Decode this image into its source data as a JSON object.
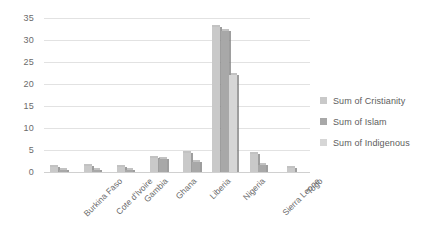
{
  "chart_data": {
    "type": "bar",
    "title": "",
    "subtitle": "",
    "xlabel": "",
    "ylabel": "",
    "ylim": [
      0,
      35
    ],
    "ytick_step": 5,
    "yticks": [
      "0",
      "5",
      "10",
      "15",
      "20",
      "25",
      "30",
      "35"
    ],
    "grid": true,
    "legend_position": "right",
    "categories": [
      "Burkina Faso",
      "Cote d'Ivoire",
      "Gambia",
      "Ghana",
      "Liberia",
      "Nigeria",
      "Sierra Leone",
      "Togo"
    ],
    "series": [
      {
        "name": "Sum of Cristianity",
        "color": "#c9c9c9",
        "values": [
          1.2,
          1.3,
          1.2,
          3.1,
          4.3,
          33.0,
          4.0,
          1.0
        ]
      },
      {
        "name": "Sum of Islam",
        "color": "#a8a8a8",
        "values": [
          0.5,
          0.4,
          0.4,
          3.0,
          2.3,
          32.0,
          1.6,
          0.0
        ]
      },
      {
        "name": "Sum of Indigenous",
        "color": "#d6d6d6",
        "values": [
          0.0,
          0.0,
          0.0,
          0.0,
          0.0,
          22.0,
          0.0,
          0.0
        ]
      }
    ]
  },
  "legend": {
    "items": [
      {
        "label": "Sum of Cristianity",
        "color": "#c9c9c9"
      },
      {
        "label": "Sum of Islam",
        "color": "#a8a8a8"
      },
      {
        "label": "Sum of Indigenous",
        "color": "#d6d6d6"
      }
    ]
  }
}
